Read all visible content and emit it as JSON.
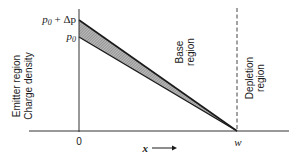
{
  "diagram": {
    "y_axis_labels": {
      "outer": "Emitter region",
      "inner": "Charge density"
    },
    "y_ticks": {
      "top_prefix": "p",
      "top_sub": "0",
      "top_suffix": " + Δp",
      "low_prefix": "p",
      "low_sub": "0"
    },
    "x_ticks": {
      "origin": "0",
      "end": "w"
    },
    "x_axis_label": "x",
    "x_axis_arrow": "⟶",
    "regions": {
      "base_line1": "Base",
      "base_line2": "region",
      "depletion_line1": "Depletion",
      "depletion_line2": "region"
    },
    "colors": {
      "line": "#1a1a1a",
      "hatch": "#8a8a8a",
      "background": "#ffffff"
    }
  }
}
